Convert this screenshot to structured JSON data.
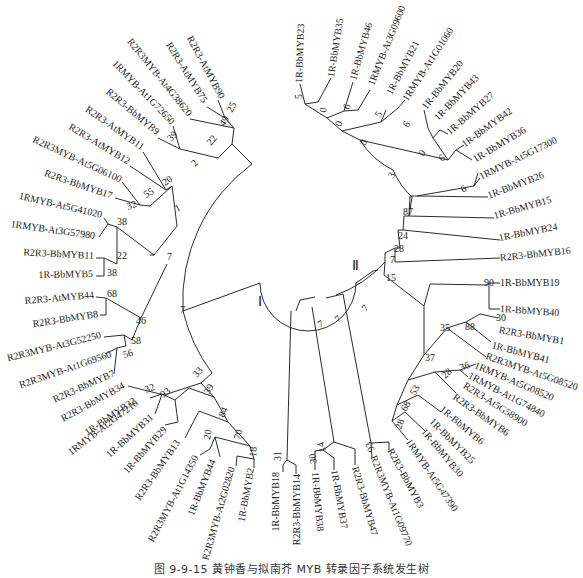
{
  "figure": {
    "caption": "图 9-9-15  黄钟香与拟南芥 MYB 转录因子系统发生树",
    "clades": [
      {
        "id": "I",
        "label": "Ⅰ",
        "x": 262,
        "y": 304
      },
      {
        "id": "II",
        "label": "Ⅱ",
        "x": 357,
        "y": 268
      }
    ],
    "center": {
      "x": 292,
      "y": 310,
      "inner_radius": 48
    }
  },
  "chart_data": {
    "type": "tree",
    "title": "图 9-9-15 黄钟香与拟南芥 MYB 转录因子系统发生树",
    "layout": "circular",
    "leaves": [
      {
        "name": "R2R3-AtMYB90",
        "x": 222,
        "y": 98,
        "angle": 62
      },
      {
        "name": "R2R3-AtMYB75",
        "x": 205,
        "y": 102,
        "angle": 58
      },
      {
        "name": "R2R3MYB-At4G38620",
        "x": 190,
        "y": 115,
        "angle": 51
      },
      {
        "name": "1RMYB-At1G72650",
        "x": 173,
        "y": 123,
        "angle": 46
      },
      {
        "name": "R2R3-BbMYB9",
        "x": 158,
        "y": 133,
        "angle": 40
      },
      {
        "name": "R2R3-AtMYB11",
        "x": 143,
        "y": 148,
        "angle": 35
      },
      {
        "name": "R2R3-AtMYB12",
        "x": 129,
        "y": 162,
        "angle": 31
      },
      {
        "name": "R2R3MYB-At5G06100",
        "x": 121,
        "y": 180,
        "angle": 25
      },
      {
        "name": "R2R3-BbMYB17",
        "x": 112,
        "y": 196,
        "angle": 19
      },
      {
        "name": "1RMYB-At5G41020",
        "x": 102,
        "y": 215,
        "angle": 13
      },
      {
        "name": "1RMYB-At3G57980",
        "x": 95,
        "y": 236,
        "angle": 8
      },
      {
        "name": "R2R3-BbMYB11",
        "x": 94,
        "y": 256,
        "angle": 3
      },
      {
        "name": "1R-BbMYB5",
        "x": 93,
        "y": 274,
        "angle": -1
      },
      {
        "name": "R2R3-AtMYB44",
        "x": 94,
        "y": 295,
        "angle": -5
      },
      {
        "name": "R2R3-BbMYB8",
        "x": 98,
        "y": 314,
        "angle": -9
      },
      {
        "name": "R2R3MYB-At3G52250",
        "x": 101,
        "y": 335,
        "angle": -14
      },
      {
        "name": "R2R3MYB-At1G69560",
        "x": 111,
        "y": 354,
        "angle": -19
      },
      {
        "name": "R2R3-BbMYB7",
        "x": 114,
        "y": 373,
        "angle": -24
      },
      {
        "name": "R2R3-BbMYB34",
        "x": 124,
        "y": 385,
        "angle": -29
      },
      {
        "name": "1R-BbMYB32",
        "x": 135,
        "y": 400,
        "angle": -34
      },
      {
        "name": "1RMYB-At2G47210",
        "x": 137,
        "y": 402,
        "angle": -37
      },
      {
        "name": "1R-BbMYB31",
        "x": 152,
        "y": 416,
        "angle": -42
      },
      {
        "name": "1R-BbMYB29",
        "x": 165,
        "y": 428,
        "angle": -48
      },
      {
        "name": "R2R3-BbMYB13",
        "x": 178,
        "y": 441,
        "angle": -55
      },
      {
        "name": "R2R3MYB-At1G14350",
        "x": 196,
        "y": 456,
        "angle": -62
      },
      {
        "name": "1R-BbMYB44",
        "x": 213,
        "y": 460,
        "angle": -68
      },
      {
        "name": "R2R3MYB-At2G02820",
        "x": 232,
        "y": 467,
        "angle": -74
      },
      {
        "name": "1R-BbMYB2",
        "x": 251,
        "y": 468,
        "angle": -80
      },
      {
        "name": "1R-BbMYB18",
        "x": 276,
        "y": 472,
        "angle": -90
      },
      {
        "name": "R2R3-BbMYB14",
        "x": 297,
        "y": 474,
        "angle": -90
      },
      {
        "name": "1R-BbMYB38",
        "x": 315,
        "y": 472,
        "angle": -95
      },
      {
        "name": "1R-BbMYB37",
        "x": 334,
        "y": 470,
        "angle": -100
      },
      {
        "name": "R2R3-BbMYB47",
        "x": 355,
        "y": 467,
        "angle": -106
      },
      {
        "name": "R2R3MYB-At1G09770",
        "x": 373,
        "y": 456,
        "angle": -112
      },
      {
        "name": "R2R3-BbMYB3",
        "x": 390,
        "y": 449,
        "angle": -118
      },
      {
        "name": "1RMYB-At5G47390",
        "x": 408,
        "y": 440,
        "angle": -124
      },
      {
        "name": "1R-BbMYB30",
        "x": 423,
        "y": 430,
        "angle": -130
      },
      {
        "name": "1R-BbMYB25",
        "x": 431,
        "y": 420,
        "angle": -135
      },
      {
        "name": "1R-BbMYB6",
        "x": 441,
        "y": 408,
        "angle": -140
      },
      {
        "name": "R2R3-BbMYB6",
        "x": 454,
        "y": 396,
        "angle": -145
      },
      {
        "name": "R2R3-At5G58900",
        "x": 464,
        "y": 385,
        "angle": -148
      },
      {
        "name": "1RMYB-At1G74840",
        "x": 469,
        "y": 375,
        "angle": -152
      },
      {
        "name": "1RMYB-At5G08520",
        "x": 475,
        "y": 365,
        "angle": -157
      },
      {
        "name": "R2R3MYB-At5G08520",
        "x": 486,
        "y": 356,
        "angle": -161
      },
      {
        "name": "1R-BbMYB41",
        "x": 492,
        "y": 345,
        "angle": -165
      },
      {
        "name": "R2R3-BbMYB1",
        "x": 499,
        "y": 330,
        "angle": -170
      },
      {
        "name": "1R-BbMYB40",
        "x": 500,
        "y": 309,
        "angle": -176
      },
      {
        "name": "1R-BbMYB19",
        "x": 500,
        "y": 283,
        "angle": 180
      },
      {
        "name": "R2R3-BbMYB16",
        "x": 500,
        "y": 258,
        "angle": 174
      },
      {
        "name": "1R-BbMYB24",
        "x": 499,
        "y": 238,
        "angle": 169
      },
      {
        "name": "1R-BbMYB15",
        "x": 494,
        "y": 216,
        "angle": 164
      },
      {
        "name": "1R-BbMYB26",
        "x": 488,
        "y": 196,
        "angle": 159
      },
      {
        "name": "1RMYB-At5G17300",
        "x": 480,
        "y": 177,
        "angle": 154
      },
      {
        "name": "1R-BbMYB36",
        "x": 474,
        "y": 160,
        "angle": 149
      },
      {
        "name": "1R-BbMYB42",
        "x": 463,
        "y": 145,
        "angle": 144
      },
      {
        "name": "1R-BbMYB27",
        "x": 448,
        "y": 133,
        "angle": 139
      },
      {
        "name": "1R-BbMYB43",
        "x": 436,
        "y": 119,
        "angle": 134
      },
      {
        "name": "1R-BbMYB20",
        "x": 424,
        "y": 108,
        "angle": 129
      },
      {
        "name": "1RMYB-At1G01060",
        "x": 405,
        "y": 100,
        "angle": 123
      },
      {
        "name": "1R-BbMYB21",
        "x": 389,
        "y": 94,
        "angle": 118
      },
      {
        "name": "1RMYB-At3G09600",
        "x": 371,
        "y": 85,
        "angle": 112
      },
      {
        "name": "1R-BbMYB46",
        "x": 353,
        "y": 80,
        "angle": 106
      },
      {
        "name": "1R-BbMYB35",
        "x": 331,
        "y": 77,
        "angle": 99
      },
      {
        "name": "1R-BbMYB23",
        "x": 299,
        "y": 83,
        "angle": 92
      }
    ],
    "bootstrap": [
      {
        "value": "25",
        "x": 232,
        "y": 113,
        "angle": -62
      },
      {
        "value": "49",
        "x": 224,
        "y": 127,
        "angle": -55
      },
      {
        "value": "22",
        "x": 211,
        "y": 146,
        "angle": -50
      },
      {
        "value": "39",
        "x": 171,
        "y": 142,
        "angle": -45
      },
      {
        "value": "2",
        "x": 195,
        "y": 167,
        "angle": -45
      },
      {
        "value": "20",
        "x": 165,
        "y": 186,
        "angle": -35
      },
      {
        "value": "55",
        "x": 146,
        "y": 198,
        "angle": -30
      },
      {
        "value": "32",
        "x": 128,
        "y": 210,
        "angle": -20
      },
      {
        "value": "1",
        "x": 177,
        "y": 212,
        "angle": -30
      },
      {
        "value": "38",
        "x": 117,
        "y": 225,
        "angle": 0
      },
      {
        "value": "22",
        "x": 117,
        "y": 259,
        "angle": 0
      },
      {
        "value": "38",
        "x": 107,
        "y": 276,
        "angle": 0
      },
      {
        "value": "7",
        "x": 167,
        "y": 260,
        "angle": 0
      },
      {
        "value": "68",
        "x": 107,
        "y": 297,
        "angle": 0
      },
      {
        "value": "46",
        "x": 136,
        "y": 324,
        "angle": 0
      },
      {
        "value": "7",
        "x": 180,
        "y": 313,
        "angle": 0
      },
      {
        "value": "58",
        "x": 131,
        "y": 344,
        "angle": 0
      },
      {
        "value": "56",
        "x": 124,
        "y": 358,
        "angle": -15
      },
      {
        "value": "33",
        "x": 197,
        "y": 378,
        "angle": -50
      },
      {
        "value": "32",
        "x": 146,
        "y": 393,
        "angle": -20
      },
      {
        "value": "93",
        "x": 163,
        "y": 398,
        "angle": -35
      },
      {
        "value": "39",
        "x": 209,
        "y": 395,
        "angle": -60
      },
      {
        "value": "84",
        "x": 224,
        "y": 418,
        "angle": -65
      },
      {
        "value": "20",
        "x": 210,
        "y": 440,
        "angle": -80
      },
      {
        "value": "70",
        "x": 240,
        "y": 440,
        "angle": -75
      },
      {
        "value": "18",
        "x": 256,
        "y": 457,
        "angle": -85
      },
      {
        "value": "31",
        "x": 281,
        "y": 461,
        "angle": -90
      },
      {
        "value": "7",
        "x": 320,
        "y": 328,
        "angle": -30
      },
      {
        "value": "7",
        "x": 338,
        "y": 323,
        "angle": -40
      },
      {
        "value": "7",
        "x": 366,
        "y": 312,
        "angle": -50
      },
      {
        "value": "14",
        "x": 326,
        "y": 451,
        "angle": -105
      },
      {
        "value": "30",
        "x": 317,
        "y": 463,
        "angle": -100
      },
      {
        "value": "93",
        "x": 375,
        "y": 450,
        "angle": -115
      },
      {
        "value": "15",
        "x": 386,
        "y": 281,
        "angle": 0
      },
      {
        "value": "7",
        "x": 390,
        "y": 263,
        "angle": 0
      },
      {
        "value": "28",
        "x": 394,
        "y": 252,
        "angle": 0
      },
      {
        "value": "24",
        "x": 398,
        "y": 239,
        "angle": 0
      },
      {
        "value": "87",
        "x": 403,
        "y": 215,
        "angle": 0
      },
      {
        "value": "3",
        "x": 393,
        "y": 179,
        "angle": -60
      },
      {
        "value": "90",
        "x": 484,
        "y": 286,
        "angle": 0
      },
      {
        "value": "35",
        "x": 440,
        "y": 331,
        "angle": 0
      },
      {
        "value": "30",
        "x": 496,
        "y": 321,
        "angle": 0
      },
      {
        "value": "88",
        "x": 465,
        "y": 330,
        "angle": 0
      },
      {
        "value": "37",
        "x": 425,
        "y": 361,
        "angle": 0
      },
      {
        "value": "36",
        "x": 461,
        "y": 371,
        "angle": -20
      },
      {
        "value": "28",
        "x": 445,
        "y": 379,
        "angle": -40
      },
      {
        "value": "53",
        "x": 415,
        "y": 396,
        "angle": -60
      },
      {
        "value": "68",
        "x": 406,
        "y": 412,
        "angle": -60
      },
      {
        "value": "28",
        "x": 401,
        "y": 430,
        "angle": -70
      },
      {
        "value": "5",
        "x": 302,
        "y": 99,
        "angle": -90
      },
      {
        "value": "0",
        "x": 326,
        "y": 113,
        "angle": -80
      },
      {
        "value": "6",
        "x": 349,
        "y": 110,
        "angle": -70
      },
      {
        "value": "0",
        "x": 341,
        "y": 127,
        "angle": -70
      },
      {
        "value": "5",
        "x": 380,
        "y": 118,
        "angle": -60
      },
      {
        "value": "0",
        "x": 365,
        "y": 146,
        "angle": -60
      },
      {
        "value": "6",
        "x": 408,
        "y": 128,
        "angle": -60
      },
      {
        "value": "0",
        "x": 423,
        "y": 157,
        "angle": -50
      },
      {
        "value": "6",
        "x": 442,
        "y": 162,
        "angle": -40
      },
      {
        "value": "6",
        "x": 463,
        "y": 193,
        "angle": -30
      }
    ]
  }
}
